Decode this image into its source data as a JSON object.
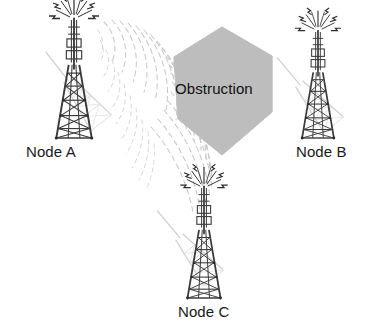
{
  "figure": {
    "kind": "network-obstruction-diagram",
    "background_color": "#ffffff",
    "width": 373,
    "height": 332
  },
  "obstruction": {
    "label": "Obstruction",
    "shape": "hexagon",
    "fill_color": "#bdbdbd",
    "edge_color": "#a8a8a8",
    "text_color": "#111111"
  },
  "nodes": [
    {
      "id": "node-a",
      "label": "Node A",
      "icon": "radio-tower-icon",
      "tower_color": "#3b3b3b",
      "shadow_color": "#d9d9d9",
      "emits_waves": true
    },
    {
      "id": "node-b",
      "label": "Node B",
      "icon": "radio-tower-icon",
      "tower_color": "#3b3b3b",
      "shadow_color": "#d9d9d9",
      "emits_waves": false
    },
    {
      "id": "node-c",
      "label": "Node C",
      "icon": "radio-tower-icon",
      "tower_color": "#3b3b3b",
      "shadow_color": "#d9d9d9",
      "emits_waves": false
    }
  ],
  "signal": {
    "source_node": "node-a",
    "wave_color": "#c9c9c9",
    "wave_style": "dashed-arcs",
    "radiation_icon": "lightning-bolt-icon",
    "radiation_color": "#2e2e2e"
  }
}
